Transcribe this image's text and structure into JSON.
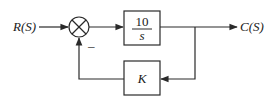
{
  "diagram": {
    "type": "control-system-block-diagram",
    "input": {
      "label": "R(S)"
    },
    "output": {
      "label": "C(S)"
    },
    "summing_junction": {
      "symbol": "⊗",
      "feedback_sign": "–"
    },
    "forward_block": {
      "numerator": "10",
      "denominator": "s"
    },
    "feedback_block": {
      "label": "K"
    },
    "colors": {
      "stroke": "#2a2a2a",
      "text": "#1a1a1a",
      "background": "#ffffff"
    }
  }
}
